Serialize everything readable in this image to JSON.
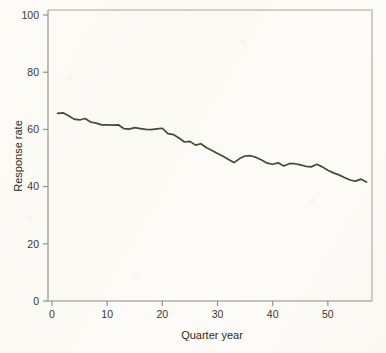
{
  "chart_data": {
    "type": "line",
    "title": "",
    "xlabel": "Quarter year",
    "ylabel": "Response rate",
    "xlim": [
      0,
      58
    ],
    "ylim": [
      0,
      100
    ],
    "grid": false,
    "legend": null,
    "x_ticks": [
      0,
      10,
      20,
      30,
      40,
      50
    ],
    "y_ticks": [
      0,
      20,
      40,
      60,
      80,
      100
    ],
    "series": [
      {
        "name": "Response rate",
        "x": [
          1,
          2,
          3,
          4,
          5,
          6,
          7,
          8,
          9,
          10,
          11,
          12,
          13,
          14,
          15,
          16,
          17,
          18,
          19,
          20,
          21,
          22,
          23,
          24,
          25,
          26,
          27,
          28,
          29,
          30,
          31,
          32,
          33,
          34,
          35,
          36,
          37,
          38,
          39,
          40,
          41,
          42,
          43,
          44,
          45,
          46,
          47,
          48,
          49,
          50,
          51,
          52,
          53,
          54,
          55,
          56,
          57
        ],
        "values": [
          65.6,
          65.8,
          64.8,
          63.6,
          63.3,
          63.8,
          62.6,
          62.2,
          61.6,
          61.6,
          61.5,
          61.6,
          60.3,
          60.1,
          60.6,
          60.3,
          60.0,
          59.9,
          60.2,
          60.4,
          58.5,
          58.2,
          57.0,
          55.6,
          55.8,
          54.5,
          55.0,
          53.6,
          52.6,
          51.6,
          50.6,
          49.5,
          48.4,
          49.8,
          50.7,
          50.8,
          50.2,
          49.3,
          48.2,
          47.8,
          48.3,
          47.2,
          48.0,
          48.0,
          47.6,
          47.1,
          46.9,
          47.8,
          46.9,
          45.7,
          44.8,
          44.1,
          43.2,
          42.3,
          41.9,
          42.6,
          41.6
        ]
      }
    ]
  },
  "axes": {
    "y_label": "Response rate",
    "x_label": "Quarter year",
    "y_tick_labels": [
      "0",
      "20",
      "40",
      "60",
      "80",
      "100"
    ],
    "x_tick_labels": [
      "0",
      "10",
      "20",
      "30",
      "40",
      "50"
    ]
  },
  "colors": {
    "line": "#4a463c",
    "axis": "#8b8a82",
    "frame": "#a8a79d",
    "text": "#2e2b24",
    "background": "#fbfaf6"
  }
}
